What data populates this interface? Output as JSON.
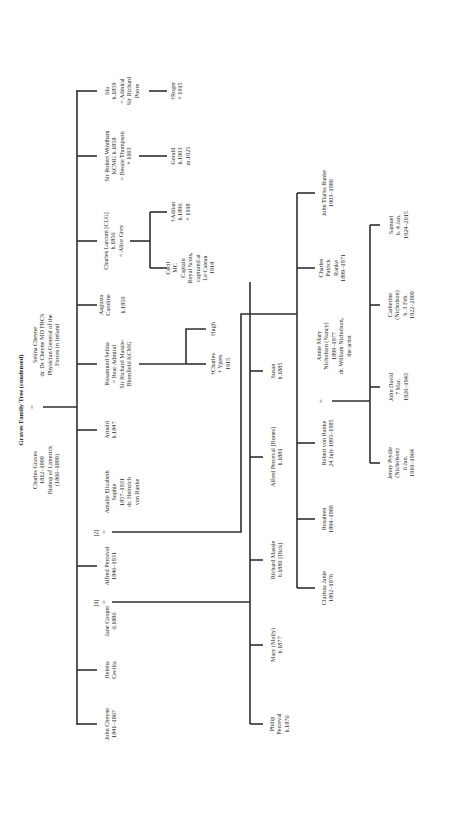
{
  "diagram": {
    "title": "Graves Family Tree (condensed)",
    "orientation": "rotated 90° counter-clockwise",
    "generation_1": {
      "father": {
        "name": "Charles Graves",
        "dates": "1812–1899",
        "note": "Bishop of Limerick",
        "tenure": "(1866–1899)"
      },
      "marriage_symbol": "=",
      "mother": {
        "name": "Selina Cheyne",
        "line2": "dr. Dr Cheyne MD FRCS",
        "line3": "Physician General of the",
        "line4": "Forces in Ireland"
      }
    },
    "generation_2": [
      {
        "id": "john-cheyne",
        "line1": "John Cheyne",
        "line2": "1841–1867"
      },
      {
        "id": "helena-cecilia",
        "line1": "Helena",
        "line2": "Cecilia"
      },
      {
        "id": "jane-cooper",
        "line1": "Jane Cooper",
        "line2": "d.1886",
        "marriage_index": "[1]"
      },
      {
        "id": "alfred-perceval",
        "line1": "Alfred Perceval",
        "line2": "1846–1931"
      },
      {
        "id": "amalie",
        "marriage_index": "[2]",
        "line1": "Amalie Elizabeth",
        "line2": "Sophie",
        "line3": "1857–1931",
        "line4": "dr. Heinrich",
        "line5": "von Ranke"
      },
      {
        "id": "arnold",
        "line1": "Arnold",
        "line2": "b.1847"
      },
      {
        "id": "rosamund",
        "line1": "Rosamund Selina",
        "line2": "= Rear Admiral",
        "line3": "Sir Richard Massie-",
        "line4": "Blomfield KCMG"
      },
      {
        "id": "augusta",
        "line1": "Augusta",
        "line2": "Caroline",
        "line3": "b.1850"
      },
      {
        "id": "charles-larcom",
        "line1": "Charles Larcom [CLG]",
        "line2": "b.1856",
        "line3": "= Alice Grey"
      },
      {
        "id": "robert-windham",
        "line1": "Sir Robert Windham",
        "line2": "KCMG b.1858",
        "line3": "= Bessie Thompson",
        "line4": "+ 1903"
      },
      {
        "id": "ida",
        "line1": "Ida",
        "line2": "b.1859",
        "line3": "= Admiral",
        "line4": "Sir Richard",
        "line5": "Poore"
      }
    ],
    "generation_3_jane_cooper": [
      {
        "id": "philip",
        "line1": "Philip",
        "line2": "Perceval",
        "line3": "b.1876"
      },
      {
        "id": "mary",
        "line1": "Mary (Molly)",
        "line2": "b.1877"
      },
      {
        "id": "richard",
        "line1": "Richard Massie",
        "line2": "b.1880 [Dick]"
      },
      {
        "id": "alfred-bones",
        "line1": "Alfred Perceval [Bones]",
        "line2": "b.1881"
      },
      {
        "id": "susan",
        "line1": "Susan",
        "line2": "b.1885"
      }
    ],
    "generation_3_amalie": [
      {
        "id": "clarissa",
        "line1": "Clarissa Janie",
        "line2": "1892–1976"
      },
      {
        "id": "rosaleen",
        "line1": "Rosaleen",
        "line2": "1894–1989"
      },
      {
        "id": "robert-ranke",
        "line1": "Robert von Ranke",
        "line2": "24 July 1895–1985"
      },
      {
        "id": "charles-patrick",
        "line1": "Charles",
        "line2": "Patrick",
        "line3": "Ranke",
        "line4": "1899–1971"
      },
      {
        "id": "john-tiarks",
        "line1": "John Tiarks Ranke",
        "line2": "1903–1980"
      }
    ],
    "generation_3_others": [
      {
        "id": "charles-ypres",
        "line1": "†Charles",
        "line2": "+ Ypres",
        "line3": "1915"
      },
      {
        "id": "hugh",
        "line1": "Hugh"
      },
      {
        "id": "cecil",
        "line1": "Cecil",
        "line2": "MC",
        "line3": "Captain",
        "line4": "Royal Scots,",
        "line5": "captured at",
        "line6": "Le Cateau",
        "line7": "1914"
      },
      {
        "id": "adrian",
        "line1": "†Adrian",
        "line2": "b.1896",
        "line3": "+ 1918"
      },
      {
        "id": "gerald",
        "line1": "Gerald",
        "line2": "b.1903",
        "line3": "m.1925"
      },
      {
        "id": "roger",
        "line1": "†Roger",
        "line2": "+ 1915"
      }
    ],
    "nancy": {
      "marriage_symbol": "=",
      "line1": "Annie Mary",
      "line2": "Nicholson (Nancy)",
      "line3": "1899–1977",
      "line4": "dr. William Nicholson,",
      "line5": "the artist"
    },
    "generation_4": [
      {
        "id": "jenny",
        "line1": "Jenny Prydie",
        "line2": "(Nicholson)",
        "line3": "6 Jan.",
        "line4": "1919–1964"
      },
      {
        "id": "john-david",
        "line1": "John David",
        "line2": "7 Mar.",
        "line3": "1920–1943"
      },
      {
        "id": "catherine",
        "line1": "Catherine",
        "line2": "(Nicholson)",
        "line3": "b. 3 Feb.",
        "line4": "1922–2009"
      },
      {
        "id": "samuel",
        "line1": "Samuel",
        "line2": "b. 4 Jan.",
        "line3": "1924–2015"
      }
    ]
  },
  "colors": {
    "background": "#ffffff",
    "line": "#2f2f2f",
    "text": "#2b2b2b"
  }
}
